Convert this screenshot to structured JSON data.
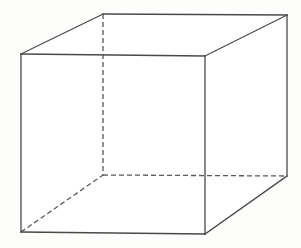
{
  "figure": {
    "kind": "wireframe-cube",
    "canvas": {
      "width": 301,
      "height": 248,
      "background_color": "#fdfdfc"
    },
    "style": {
      "visible_edge_color": "#4a4a4a",
      "hidden_edge_color": "#5a5a5a",
      "face_color": "#ffffff",
      "visible_edge_width": 1.3,
      "hidden_edge_width": 1.3,
      "hidden_dash_pattern": "5,3"
    },
    "vertices": {
      "front_top_left": {
        "label": "A",
        "x": 21,
        "y": 54,
        "hidden": false
      },
      "front_top_right": {
        "label": "B",
        "x": 205,
        "y": 56,
        "hidden": false
      },
      "front_bottom_right": {
        "label": "C",
        "x": 205,
        "y": 234,
        "hidden": false
      },
      "front_bottom_left": {
        "label": "D",
        "x": 21,
        "y": 232,
        "hidden": false
      },
      "back_top_left": {
        "label": "E",
        "x": 103,
        "y": 14,
        "hidden": false
      },
      "back_top_right": {
        "label": "F",
        "x": 287,
        "y": 15,
        "hidden": false
      },
      "back_bottom_right": {
        "label": "G",
        "x": 287,
        "y": 176,
        "hidden": false
      },
      "back_bottom_left": {
        "label": "H",
        "x": 103,
        "y": 175,
        "hidden": true
      }
    },
    "faces": {
      "front": "21,54 205,56 205,234 21,232",
      "top": "21,54 103,14 287,15 205,56",
      "right": "205,56 287,15 287,176 205,234"
    },
    "edges_visible": [
      {
        "name": "front-top",
        "points": "21,54 205,56"
      },
      {
        "name": "front-right",
        "points": "205,56 205,234"
      },
      {
        "name": "front-bottom",
        "points": "21,232 205,234"
      },
      {
        "name": "front-left",
        "points": "21,54 21,232"
      },
      {
        "name": "top-back",
        "points": "103,14 287,15"
      },
      {
        "name": "top-left-diagonal",
        "points": "21,54 103,14"
      },
      {
        "name": "top-right-diagonal",
        "points": "205,56 287,15"
      },
      {
        "name": "back-right-vertical",
        "points": "287,15 287,176"
      },
      {
        "name": "bottom-right-diagonal",
        "points": "205,234 287,176"
      }
    ],
    "edges_hidden": [
      {
        "name": "back-left-vertical",
        "points": "103,14 103,175"
      },
      {
        "name": "back-bottom",
        "points": "103,175 287,176"
      },
      {
        "name": "bottom-left-diagonal",
        "points": "21,232 103,175"
      }
    ]
  }
}
